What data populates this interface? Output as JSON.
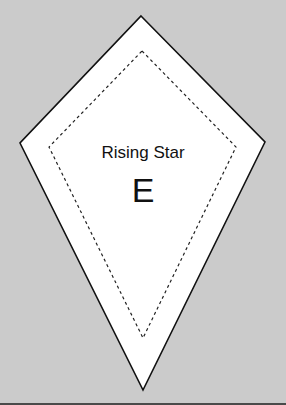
{
  "template": {
    "name": "Rising Star",
    "piece_letter": "E",
    "shape": "kite",
    "background_color": "#cbcbcb",
    "fill_color": "#ffffff",
    "outline_color": "#111111",
    "outer_outline": {
      "style": "solid",
      "points": [
        [
          141,
          16
        ],
        [
          265,
          142
        ],
        [
          143,
          390
        ],
        [
          20,
          143
        ]
      ]
    },
    "inner_seam_line": {
      "style": "dashed",
      "points": [
        [
          142,
          51
        ],
        [
          236,
          147
        ],
        [
          143,
          338
        ],
        [
          49,
          147
        ]
      ]
    }
  }
}
